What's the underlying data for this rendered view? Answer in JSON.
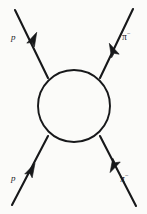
{
  "figure": {
    "kind": "feynman-scattering-diagram",
    "background_color": "#fbfbf9",
    "ink_color": "#17181a",
    "blob": {
      "name": "interaction-blob",
      "shape": "circle",
      "center_x": 74,
      "center_y": 106,
      "radius": 36
    },
    "legs": [
      {
        "id": "incoming-top-left",
        "label": "p",
        "direction": "incoming",
        "from_x": 15,
        "from_y": 10,
        "to_x": 48,
        "to_y": 78,
        "arrow_x": 33,
        "arrow_y": 40,
        "arrow_angle": -116
      },
      {
        "id": "incoming-bottom-left",
        "label": "p",
        "direction": "incoming",
        "from_x": 12,
        "from_y": 205,
        "to_x": 48,
        "to_y": 136,
        "arrow_x": 31,
        "arrow_y": 171,
        "arrow_angle": -62
      },
      {
        "id": "outgoing-top-right",
        "label": "π",
        "label_superscript": "−",
        "direction": "outgoing",
        "from_x": 100,
        "from_y": 78,
        "to_x": 133,
        "to_y": 9,
        "arrow_x": 113,
        "arrow_y": 51,
        "arrow_angle": -64
      },
      {
        "id": "outgoing-bottom-right",
        "label": "π",
        "label_superscript": "−",
        "direction": "outgoing",
        "from_x": 100,
        "from_y": 136,
        "to_x": 136,
        "to_y": 206,
        "arrow_x": 114,
        "arrow_y": 165,
        "arrow_angle": -118
      }
    ]
  },
  "labels": {
    "incoming_top": "p",
    "incoming_bottom": "p",
    "outgoing_top_base": "π",
    "outgoing_top_sup": "−",
    "outgoing_bottom_base": "π",
    "outgoing_bottom_sup": "−"
  }
}
